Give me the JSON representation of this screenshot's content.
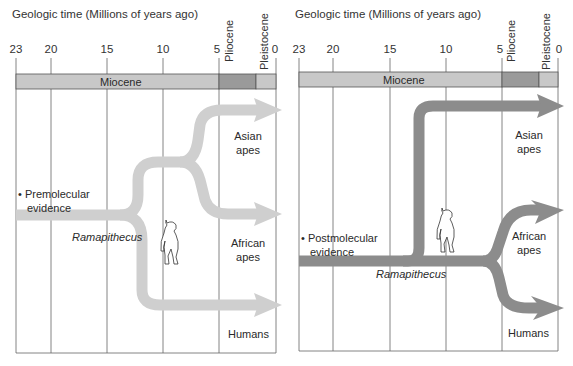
{
  "axis": {
    "title": "Geologic time (Millions of years ago)",
    "ticks": [
      "23",
      "20",
      "15",
      "10",
      "5",
      "0"
    ]
  },
  "epochs": {
    "miocene": "Miocene",
    "pliocene": "Pliocene",
    "pleistocene": "Pleistocene"
  },
  "colors": {
    "band": "#c8c8c8",
    "band_pliocene": "#9a9a9a",
    "band_pleistocene": "#c8c8c8",
    "premolecular_arrow": "#cfcfcf",
    "postmolecular_arrow": "#8c8c8c",
    "grid": "#555555"
  },
  "left_panel": {
    "evidence_label_line1": "• Premolecular",
    "evidence_label_line2": "evidence",
    "ramapithecus": "Ramapithecus",
    "branches": {
      "asian_line1": "Asian",
      "asian_line2": "apes",
      "african_line1": "African",
      "african_line2": "apes",
      "humans": "Humans"
    }
  },
  "right_panel": {
    "evidence_label_line1": "• Postmolecular",
    "evidence_label_line2": "evidence",
    "ramapithecus": "Ramapithecus",
    "branches": {
      "asian_line1": "Asian",
      "asian_line2": "apes",
      "african_line1": "African",
      "african_line2": "apes",
      "humans": "Humans"
    }
  }
}
